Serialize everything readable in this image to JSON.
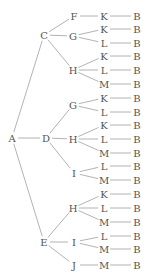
{
  "diagram": {
    "type": "tree",
    "orientation": "left-to-right",
    "colors": {
      "text": "#555555",
      "edge": "#a0a0a0",
      "background": "#ffffff"
    },
    "nodes": [
      {
        "id": "A",
        "label": "A",
        "x": 12,
        "y": 138
      },
      {
        "id": "C",
        "label": "C",
        "x": 44,
        "y": 35
      },
      {
        "id": "D",
        "label": "D",
        "x": 46,
        "y": 138
      },
      {
        "id": "E",
        "label": "E",
        "x": 44,
        "y": 242
      },
      {
        "id": "CF",
        "label": "F",
        "x": 74,
        "y": 16
      },
      {
        "id": "CG",
        "label": "G",
        "x": 73,
        "y": 36
      },
      {
        "id": "CH",
        "label": "H",
        "x": 73,
        "y": 70
      },
      {
        "id": "DG",
        "label": "G",
        "x": 73,
        "y": 105
      },
      {
        "id": "DH",
        "label": "H",
        "x": 73,
        "y": 139
      },
      {
        "id": "DI",
        "label": "I",
        "x": 74,
        "y": 173
      },
      {
        "id": "EH",
        "label": "H",
        "x": 73,
        "y": 208
      },
      {
        "id": "EI",
        "label": "I",
        "x": 74,
        "y": 242
      },
      {
        "id": "EJ",
        "label": "J",
        "x": 74,
        "y": 265
      },
      {
        "id": "CFK",
        "label": "K",
        "x": 104,
        "y": 16
      },
      {
        "id": "CGK",
        "label": "K",
        "x": 104,
        "y": 29
      },
      {
        "id": "CGL",
        "label": "L",
        "x": 104,
        "y": 43
      },
      {
        "id": "CHK",
        "label": "K",
        "x": 104,
        "y": 56
      },
      {
        "id": "CHL",
        "label": "L",
        "x": 104,
        "y": 70
      },
      {
        "id": "CHM",
        "label": "M",
        "x": 104,
        "y": 84
      },
      {
        "id": "DGK",
        "label": "K",
        "x": 104,
        "y": 98
      },
      {
        "id": "DGL",
        "label": "L",
        "x": 104,
        "y": 112
      },
      {
        "id": "DHK",
        "label": "K",
        "x": 104,
        "y": 125
      },
      {
        "id": "DHL",
        "label": "L",
        "x": 104,
        "y": 139
      },
      {
        "id": "DHM",
        "label": "M",
        "x": 104,
        "y": 153
      },
      {
        "id": "DIL",
        "label": "L",
        "x": 104,
        "y": 166
      },
      {
        "id": "DIM",
        "label": "M",
        "x": 104,
        "y": 180
      },
      {
        "id": "EHK",
        "label": "K",
        "x": 104,
        "y": 194
      },
      {
        "id": "EHL",
        "label": "L",
        "x": 104,
        "y": 208
      },
      {
        "id": "EHM",
        "label": "M",
        "x": 104,
        "y": 222
      },
      {
        "id": "EIL",
        "label": "L",
        "x": 104,
        "y": 236
      },
      {
        "id": "EIM",
        "label": "M",
        "x": 104,
        "y": 249
      },
      {
        "id": "EJM",
        "label": "M",
        "x": 104,
        "y": 265
      },
      {
        "id": "B1",
        "label": "B",
        "x": 137,
        "y": 16
      },
      {
        "id": "B2",
        "label": "B",
        "x": 137,
        "y": 29
      },
      {
        "id": "B3",
        "label": "B",
        "x": 137,
        "y": 43
      },
      {
        "id": "B4",
        "label": "B",
        "x": 137,
        "y": 56
      },
      {
        "id": "B5",
        "label": "B",
        "x": 137,
        "y": 70
      },
      {
        "id": "B6",
        "label": "B",
        "x": 137,
        "y": 84
      },
      {
        "id": "B7",
        "label": "B",
        "x": 137,
        "y": 98
      },
      {
        "id": "B8",
        "label": "B",
        "x": 137,
        "y": 112
      },
      {
        "id": "B9",
        "label": "B",
        "x": 137,
        "y": 125
      },
      {
        "id": "B10",
        "label": "B",
        "x": 137,
        "y": 139
      },
      {
        "id": "B11",
        "label": "B",
        "x": 137,
        "y": 153
      },
      {
        "id": "B12",
        "label": "B",
        "x": 137,
        "y": 166
      },
      {
        "id": "B13",
        "label": "B",
        "x": 137,
        "y": 180
      },
      {
        "id": "B14",
        "label": "B",
        "x": 137,
        "y": 194
      },
      {
        "id": "B15",
        "label": "B",
        "x": 137,
        "y": 208
      },
      {
        "id": "B16",
        "label": "B",
        "x": 137,
        "y": 222
      },
      {
        "id": "B17",
        "label": "B",
        "x": 137,
        "y": 236
      },
      {
        "id": "B18",
        "label": "B",
        "x": 137,
        "y": 249
      },
      {
        "id": "B19",
        "label": "B",
        "x": 137,
        "y": 265
      }
    ],
    "edges": [
      [
        "A",
        "C"
      ],
      [
        "A",
        "D"
      ],
      [
        "A",
        "E"
      ],
      [
        "C",
        "CF"
      ],
      [
        "C",
        "CG"
      ],
      [
        "C",
        "CH"
      ],
      [
        "D",
        "DG"
      ],
      [
        "D",
        "DH"
      ],
      [
        "D",
        "DI"
      ],
      [
        "E",
        "EH"
      ],
      [
        "E",
        "EI"
      ],
      [
        "E",
        "EJ"
      ],
      [
        "CF",
        "CFK"
      ],
      [
        "CG",
        "CGK"
      ],
      [
        "CG",
        "CGL"
      ],
      [
        "CH",
        "CHK"
      ],
      [
        "CH",
        "CHL"
      ],
      [
        "CH",
        "CHM"
      ],
      [
        "DG",
        "DGK"
      ],
      [
        "DG",
        "DGL"
      ],
      [
        "DH",
        "DHK"
      ],
      [
        "DH",
        "DHL"
      ],
      [
        "DH",
        "DHM"
      ],
      [
        "DI",
        "DIL"
      ],
      [
        "DI",
        "DIM"
      ],
      [
        "EH",
        "EHK"
      ],
      [
        "EH",
        "EHL"
      ],
      [
        "EH",
        "EHM"
      ],
      [
        "EI",
        "EIL"
      ],
      [
        "EI",
        "EIM"
      ],
      [
        "EJ",
        "EJM"
      ],
      [
        "CFK",
        "B1"
      ],
      [
        "CGK",
        "B2"
      ],
      [
        "CGL",
        "B3"
      ],
      [
        "CHK",
        "B4"
      ],
      [
        "CHL",
        "B5"
      ],
      [
        "CHM",
        "B6"
      ],
      [
        "DGK",
        "B7"
      ],
      [
        "DGL",
        "B8"
      ],
      [
        "DHK",
        "B9"
      ],
      [
        "DHL",
        "B10"
      ],
      [
        "DHM",
        "B11"
      ],
      [
        "DIL",
        "B12"
      ],
      [
        "DIM",
        "B13"
      ],
      [
        "EHK",
        "B14"
      ],
      [
        "EHL",
        "B15"
      ],
      [
        "EHM",
        "B16"
      ],
      [
        "EIL",
        "B17"
      ],
      [
        "EIM",
        "B18"
      ],
      [
        "EJM",
        "B19"
      ]
    ]
  }
}
